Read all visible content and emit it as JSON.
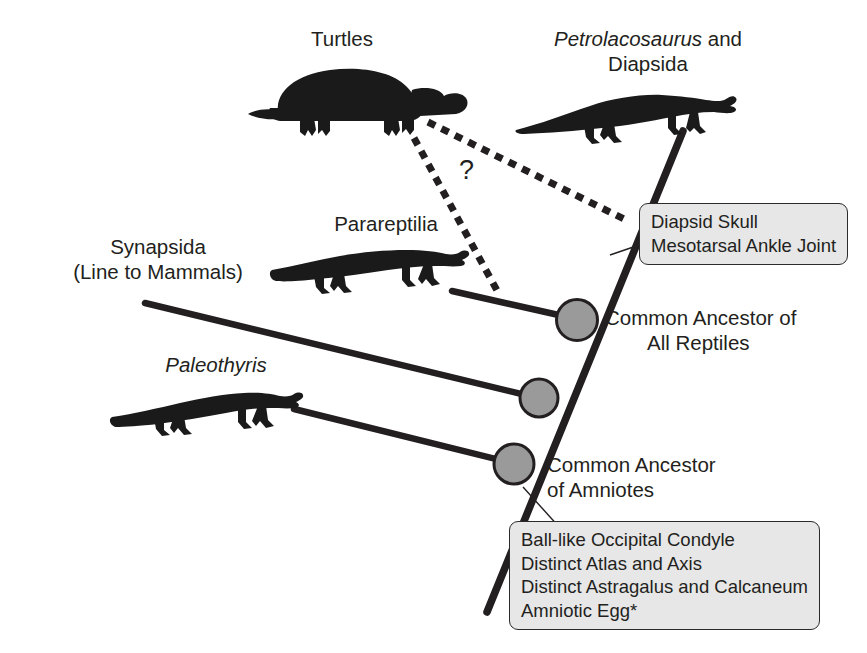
{
  "diagram": {
    "colors": {
      "line": "#231f20",
      "node_fill": "#9a9a9a",
      "node_stroke": "#231f20",
      "callout_fill": "#e7e7e7",
      "callout_stroke": "#2b2b2b",
      "silhouette": "#1a1a1a",
      "background": "#ffffff"
    },
    "taxa": [
      {
        "id": "turtles",
        "label": "Turtles",
        "italic": false
      },
      {
        "id": "petrolacosaurus",
        "label_italic": "Petrolacosaurus",
        "label_rest": " and",
        "label_line2": "Diapsida"
      },
      {
        "id": "parareptilia",
        "label": "Parareptilia",
        "italic": false
      },
      {
        "id": "synapsida",
        "label_line1": "Synapsida",
        "label_line2": "(Line to Mammals)"
      },
      {
        "id": "paleothyris",
        "label": "Paleothyris",
        "italic": true
      }
    ],
    "nodes": [
      {
        "id": "reptiles",
        "label_line1": "Common Ancestor of",
        "label_line2": "All Reptiles"
      },
      {
        "id": "middle",
        "label_line1": "",
        "label_line2": ""
      },
      {
        "id": "amniotes",
        "label_line1": "Common Ancestor",
        "label_line2": "of Amniotes"
      }
    ],
    "callouts": [
      {
        "id": "diapsid-traits",
        "items": [
          "Diapsid Skull",
          "Mesotarsal Ankle Joint"
        ]
      },
      {
        "id": "amniote-traits",
        "items": [
          "Ball-like Occipital Condyle",
          "Distinct Atlas and Axis",
          "Distinct Astragalus and Calcaneum",
          "Amniotic Egg*"
        ]
      }
    ],
    "uncertainty": {
      "marker": "?",
      "note": "dashed lines indicate uncertain placement of turtles"
    }
  }
}
